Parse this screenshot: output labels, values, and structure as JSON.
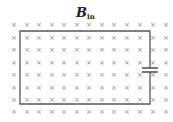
{
  "diagram": {
    "title_main": "B",
    "title_sub": "in",
    "field_symbol": "×",
    "field_color": "#8a8a8a",
    "wire_color": "#555555",
    "grid": {
      "cols": [
        14,
        27,
        39,
        52,
        64,
        77,
        89,
        102,
        114,
        127,
        140,
        153,
        166
      ],
      "rows": [
        24,
        37,
        49,
        62,
        74,
        87,
        99,
        111
      ]
    },
    "loop": {
      "x1": 20,
      "y1": 31,
      "x2": 150,
      "y2": 104
    },
    "capacitor": {
      "x": 150,
      "plate_top_y": 68,
      "plate_bottom_y": 72,
      "half_width": 8
    }
  }
}
